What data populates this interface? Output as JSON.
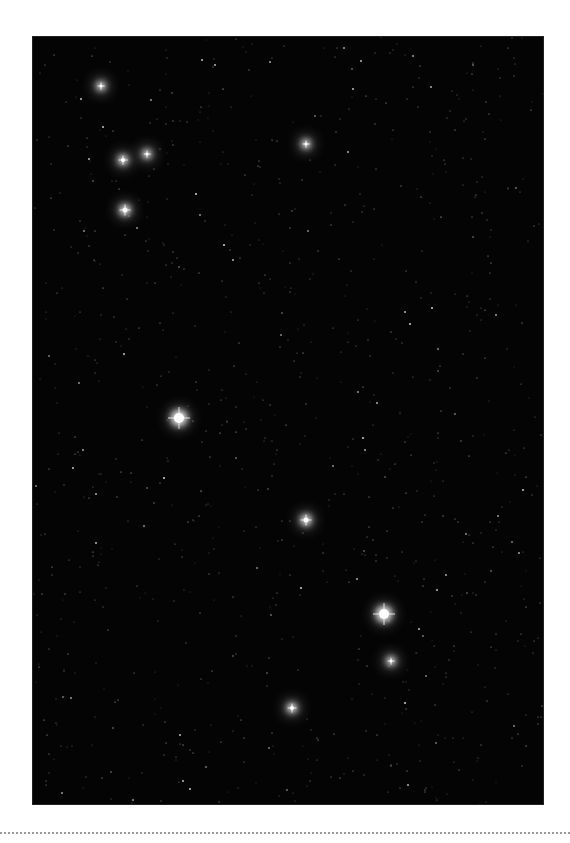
{
  "image": {
    "description": "Star field photograph",
    "bright_stars": [
      {
        "x": 178,
        "y": 417,
        "size": 10
      },
      {
        "x": 383,
        "y": 613,
        "size": 10
      },
      {
        "x": 305,
        "y": 519,
        "size": 5
      },
      {
        "x": 124,
        "y": 209,
        "size": 5
      },
      {
        "x": 122,
        "y": 159,
        "size": 4
      },
      {
        "x": 146,
        "y": 153,
        "size": 3
      },
      {
        "x": 100,
        "y": 85,
        "size": 3
      },
      {
        "x": 390,
        "y": 660,
        "size": 3
      },
      {
        "x": 291,
        "y": 707,
        "size": 4
      },
      {
        "x": 305,
        "y": 143,
        "size": 3
      }
    ]
  }
}
